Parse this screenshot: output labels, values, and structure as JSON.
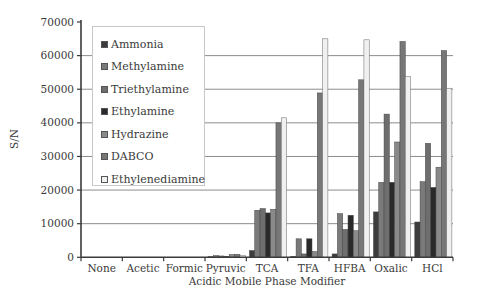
{
  "chart_data": {
    "type": "bar",
    "title": "",
    "xlabel": "Acidic Mobile Phase Modifier",
    "ylabel": "S/N",
    "ylim": [
      0,
      70000
    ],
    "yticks": [
      0,
      10000,
      20000,
      30000,
      40000,
      50000,
      60000,
      70000
    ],
    "ytick_labels": [
      "0",
      "10000",
      "20000",
      "30000",
      "40000",
      "50000",
      "60000",
      "70000"
    ],
    "grid": "horizontal",
    "legend_position": "upper-left-inside",
    "categories": [
      "None",
      "Acetic",
      "Formic",
      "Pyruvic",
      "TCA",
      "TFA",
      "HFBA",
      "Oxalic",
      "HCl"
    ],
    "series": [
      {
        "name": "Ammonia",
        "color": "#3c3c3c",
        "values": [
          0,
          0,
          0,
          200,
          2000,
          300,
          1000,
          13500,
          10500
        ]
      },
      {
        "name": "Methylamine",
        "color": "#7a7a7a",
        "values": [
          0,
          0,
          0,
          500,
          14000,
          5500,
          13000,
          22300,
          22500
        ]
      },
      {
        "name": "Triethylamine",
        "color": "#6e6e6e",
        "values": [
          0,
          0,
          0,
          400,
          14500,
          1000,
          8300,
          42600,
          33900
        ]
      },
      {
        "name": "Ethylamine",
        "color": "#2a2a2a",
        "values": [
          0,
          0,
          0,
          300,
          13200,
          5500,
          12500,
          22300,
          20800
        ]
      },
      {
        "name": "Hydrazine",
        "color": "#8a8a8a",
        "values": [
          0,
          0,
          0,
          800,
          14300,
          1700,
          7900,
          34300,
          26800
        ]
      },
      {
        "name": "DABCO",
        "color": "#777777",
        "values": [
          0,
          0,
          0,
          900,
          40000,
          48900,
          52800,
          64200,
          61500
        ]
      },
      {
        "name": "Ethylenediamine",
        "color": "#f0f0f0",
        "values": [
          0,
          0,
          0,
          500,
          41500,
          65000,
          64700,
          53800,
          50300
        ]
      }
    ]
  },
  "legend": {
    "items": [
      {
        "label": "Ammonia"
      },
      {
        "label": "Methylamine"
      },
      {
        "label": "Triethylamine"
      },
      {
        "label": "Ethylamine"
      },
      {
        "label": "Hydrazine"
      },
      {
        "label": "DABCO"
      },
      {
        "label": "Ethylenediamine"
      }
    ]
  },
  "colors": {
    "axis": "#3a3a3a",
    "grid": "#8c8c8c",
    "legend_border": "#c8c8c8"
  }
}
